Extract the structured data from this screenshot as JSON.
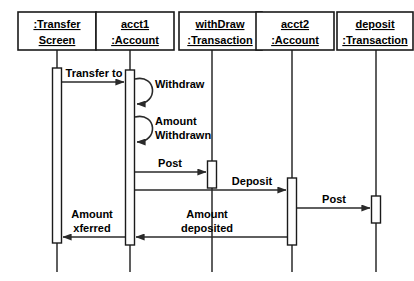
{
  "diagram": {
    "type": "uml-sequence-diagram",
    "background_color": "#ffffff",
    "line_color": "#2a2a2a",
    "text_color": "#000000",
    "participants": [
      {
        "id": "transfer-screen",
        "line1": ":Transfer",
        "line2": "Screen",
        "box": {
          "x": 18,
          "y": 12,
          "w": 78,
          "h": 38
        },
        "lifeline_x": 57,
        "activation": {
          "y": 68,
          "h": 175
        }
      },
      {
        "id": "acct1",
        "line1": "acct1",
        "line2": ":Account",
        "box": {
          "x": 96,
          "y": 12,
          "w": 78,
          "h": 38
        },
        "lifeline_x": 130,
        "activation": {
          "y": 70,
          "h": 175
        }
      },
      {
        "id": "withdraw-transaction",
        "line1": "withDraw",
        "line2": ":Transaction",
        "box": {
          "x": 179,
          "y": 12,
          "w": 83,
          "h": 38
        },
        "lifeline_x": 212,
        "activation": {
          "y": 161,
          "h": 27
        }
      },
      {
        "id": "acct2",
        "line1": "acct2",
        "line2": ":Account",
        "box": {
          "x": 256,
          "y": 12,
          "w": 78,
          "h": 38
        },
        "lifeline_x": 292,
        "activation": {
          "y": 178,
          "h": 67
        }
      },
      {
        "id": "deposit-transaction",
        "line1": "deposit",
        "line2": ":Transaction",
        "box": {
          "x": 337,
          "y": 12,
          "w": 76,
          "h": 38
        },
        "lifeline_x": 376,
        "activation": {
          "y": 196,
          "h": 27
        }
      }
    ],
    "messages": [
      {
        "id": "transfer-to",
        "label": "Transfer to",
        "label_line1": "Transfer to",
        "label_line2": "",
        "from": "transfer-screen",
        "to": "acct1",
        "direction": "right",
        "y": 82,
        "label_x": 94,
        "label_y": 76
      },
      {
        "id": "withdraw-self",
        "label": "Withdraw",
        "label_line1": "Withdraw",
        "label_line2": "",
        "from": "acct1",
        "to": "acct1",
        "direction": "self",
        "y": 89,
        "label_x": 156,
        "label_y": 86
      },
      {
        "id": "amount-withdrawn-self",
        "label": "Amount Withdrawn",
        "label_line1": "Amount",
        "label_line2": "Withdrawn",
        "from": "acct1",
        "to": "acct1",
        "direction": "self",
        "y": 127,
        "label_x": 156,
        "label_y": 124
      },
      {
        "id": "post-withdraw",
        "label": "Post",
        "label_line1": "Post",
        "label_line2": "",
        "from": "acct1",
        "to": "withdraw-transaction",
        "direction": "right",
        "y": 172,
        "label_x": 170,
        "label_y": 166
      },
      {
        "id": "deposit",
        "label": "Deposit",
        "label_line1": "Deposit",
        "label_line2": "",
        "from": "acct1",
        "to": "acct2",
        "direction": "right",
        "y": 190,
        "label_x": 250,
        "label_y": 184
      },
      {
        "id": "post-deposit",
        "label": "Post",
        "label_line1": "Post",
        "label_line2": "",
        "from": "acct2",
        "to": "deposit-transaction",
        "direction": "right",
        "y": 208,
        "label_x": 333,
        "label_y": 202
      },
      {
        "id": "amount-deposited",
        "label": "Amount deposited",
        "label_line1": "Amount",
        "label_line2": "deposited",
        "from": "acct2",
        "to": "acct1",
        "direction": "left",
        "y": 237,
        "label_x": 207,
        "label_y": 219
      },
      {
        "id": "amount-xferred",
        "label": "Amount xferred",
        "label_line1": "Amount",
        "label_line2": "xferred",
        "from": "acct1",
        "to": "transfer-screen",
        "direction": "left",
        "y": 237,
        "label_x": 92,
        "label_y": 219
      }
    ]
  }
}
